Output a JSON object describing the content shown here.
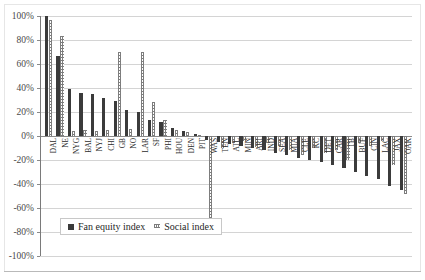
{
  "chart_data": {
    "type": "bar",
    "title": "",
    "subtitle": "",
    "xlabel": "",
    "ylabel": "",
    "ylim": [
      -100,
      100
    ],
    "ytick_labels": [
      "100%",
      "80%",
      "60%",
      "40%",
      "20%",
      "0%",
      "-20%",
      "-40%",
      "-60%",
      "-80%",
      "-100%"
    ],
    "ytick_values": [
      100,
      80,
      60,
      40,
      20,
      0,
      -20,
      -40,
      -60,
      -80,
      -100
    ],
    "grid": true,
    "legend_position": "bottom-left-inside",
    "categories": [
      "DAL",
      "NE",
      "NYG",
      "BAL",
      "NYJ",
      "CHI",
      "GB",
      "NO",
      "LAR",
      "SF",
      "PHI",
      "HOU",
      "DEN",
      "PIT",
      "WAS",
      "TEN",
      "ATL",
      "MIN",
      "ARI",
      "IND",
      "SEA",
      "MIA",
      "CLE",
      "KC",
      "DET",
      "CAR",
      "TB",
      "BUF",
      "CIN",
      "LAC",
      "JAX",
      "OAK"
    ],
    "series": [
      {
        "name": "Fan equity index",
        "style": "solid-dark",
        "color": "#3b3b3b",
        "values": [
          100,
          67,
          39,
          36,
          35,
          32,
          29,
          22,
          20,
          13,
          12,
          7,
          4,
          2,
          -3,
          -5,
          -7,
          -8,
          -10,
          -12,
          -14,
          -16,
          -18,
          -20,
          -22,
          -24,
          -27,
          -30,
          -33,
          -36,
          -42,
          -45
        ]
      },
      {
        "name": "Social index",
        "style": "dotted-light",
        "color": "#7d7d7d",
        "values": [
          97,
          83,
          4,
          5,
          4,
          5,
          70,
          6,
          70,
          28,
          13,
          5,
          3,
          1,
          -70,
          -10,
          -6,
          -4,
          -9,
          -6,
          -8,
          -12,
          -16,
          -10,
          -14,
          -12,
          -20,
          -6,
          -8,
          -4,
          -24,
          -48
        ]
      }
    ]
  },
  "legend": {
    "items": [
      {
        "label": "Fan equity index"
      },
      {
        "label": "Social index"
      }
    ]
  }
}
